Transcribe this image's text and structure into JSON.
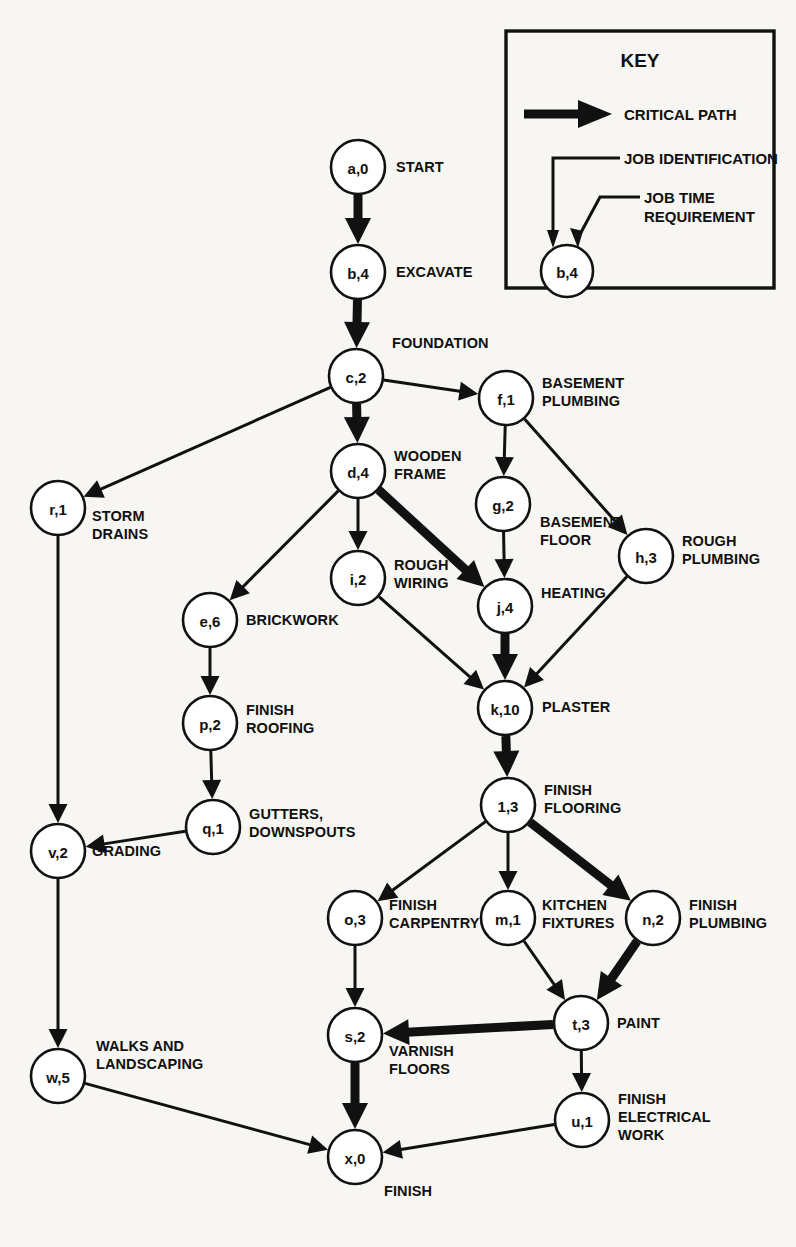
{
  "diagram": {
    "background_color": "#f7f6f2",
    "ink_color": "#111111",
    "node_fill": "#ffffff"
  },
  "key": {
    "title": "KEY",
    "critical_path_label": "CRITICAL PATH",
    "job_identification_label": "JOB IDENTIFICATION",
    "job_time_line1": "JOB TIME",
    "job_time_line2": "REQUIREMENT",
    "sample_node_label": "b,4"
  },
  "nodes": [
    {
      "id": "a",
      "label": "a,0",
      "cx": 358,
      "cy": 167,
      "r": 27,
      "job": [
        "START"
      ],
      "job_x": 396,
      "job_y": 172,
      "anchor": "start"
    },
    {
      "id": "b",
      "label": "b,4",
      "cx": 358,
      "cy": 272,
      "r": 27,
      "job": [
        "EXCAVATE"
      ],
      "job_x": 396,
      "job_y": 277,
      "anchor": "start"
    },
    {
      "id": "c",
      "label": "c,2",
      "cx": 356,
      "cy": 376,
      "r": 27,
      "job": [
        "FOUNDATION"
      ],
      "job_x": 392,
      "job_y": 348,
      "anchor": "start"
    },
    {
      "id": "d",
      "label": "d,4",
      "cx": 358,
      "cy": 471,
      "r": 27,
      "job": [
        "WOODEN",
        "FRAME"
      ],
      "job_x": 394,
      "job_y": 461,
      "anchor": "start"
    },
    {
      "id": "f",
      "label": "f,1",
      "cx": 506,
      "cy": 398,
      "r": 27,
      "job": [
        "BASEMENT",
        "PLUMBING"
      ],
      "job_x": 542,
      "job_y": 388,
      "anchor": "start"
    },
    {
      "id": "g",
      "label": "g,2",
      "cx": 503,
      "cy": 504,
      "r": 27,
      "job": [
        "BASEMENT",
        "FLOOR"
      ],
      "job_x": 540,
      "job_y": 527,
      "anchor": "start"
    },
    {
      "id": "h",
      "label": "h,3",
      "cx": 646,
      "cy": 556,
      "r": 27,
      "job": [
        "ROUGH",
        "PLUMBING"
      ],
      "job_x": 682,
      "job_y": 546,
      "anchor": "start"
    },
    {
      "id": "r",
      "label": "r,1",
      "cx": 58,
      "cy": 508,
      "r": 27,
      "job": [
        "STORM",
        "DRAINS"
      ],
      "job_x": 92,
      "job_y": 521,
      "anchor": "start"
    },
    {
      "id": "i",
      "label": "i,2",
      "cx": 358,
      "cy": 578,
      "r": 27,
      "job": [
        "ROUGH",
        "WIRING"
      ],
      "job_x": 394,
      "job_y": 570,
      "anchor": "start"
    },
    {
      "id": "j",
      "label": "j,4",
      "cx": 505,
      "cy": 606,
      "r": 27,
      "job": [
        "HEATING"
      ],
      "job_x": 541,
      "job_y": 598,
      "anchor": "start"
    },
    {
      "id": "e",
      "label": "e,6",
      "cx": 210,
      "cy": 620,
      "r": 27,
      "job": [
        "BRICKWORK"
      ],
      "job_x": 246,
      "job_y": 625,
      "anchor": "start"
    },
    {
      "id": "k",
      "label": "k,10",
      "cx": 505,
      "cy": 708,
      "r": 27,
      "job": [
        "PLASTER"
      ],
      "job_x": 542,
      "job_y": 712,
      "anchor": "start"
    },
    {
      "id": "p",
      "label": "p,2",
      "cx": 210,
      "cy": 723,
      "r": 27,
      "job": [
        "FINISH",
        "ROOFING"
      ],
      "job_x": 246,
      "job_y": 715,
      "anchor": "start"
    },
    {
      "id": "l",
      "label": "1,3",
      "cx": 508,
      "cy": 805,
      "r": 27,
      "job": [
        "FINISH",
        "FLOORING"
      ],
      "job_x": 544,
      "job_y": 795,
      "anchor": "start"
    },
    {
      "id": "q",
      "label": "q,1",
      "cx": 213,
      "cy": 827,
      "r": 27,
      "job": [
        "GUTTERS,",
        "DOWNSPOUTS"
      ],
      "job_x": 249,
      "job_y": 819,
      "anchor": "start"
    },
    {
      "id": "v",
      "label": "v,2",
      "cx": 58,
      "cy": 851,
      "r": 27,
      "job": [
        "GRADING"
      ],
      "job_x": 92,
      "job_y": 856,
      "anchor": "start"
    },
    {
      "id": "o",
      "label": "o,3",
      "cx": 355,
      "cy": 918,
      "r": 27,
      "job": [
        "FINISH",
        "CARPENTRY"
      ],
      "job_x": 389,
      "job_y": 910,
      "anchor": "start"
    },
    {
      "id": "m",
      "label": "m,1",
      "cx": 508,
      "cy": 918,
      "r": 27,
      "job": [
        "KITCHEN",
        "FIXTURES"
      ],
      "job_x": 542,
      "job_y": 910,
      "anchor": "start"
    },
    {
      "id": "n",
      "label": "n,2",
      "cx": 653,
      "cy": 918,
      "r": 27,
      "job": [
        "FINISH",
        "PLUMBING"
      ],
      "job_x": 689,
      "job_y": 910,
      "anchor": "start"
    },
    {
      "id": "t",
      "label": "t,3",
      "cx": 581,
      "cy": 1023,
      "r": 27,
      "job": [
        "PAINT"
      ],
      "job_x": 617,
      "job_y": 1028,
      "anchor": "start"
    },
    {
      "id": "s",
      "label": "s,2",
      "cx": 355,
      "cy": 1035,
      "r": 27,
      "job": [
        "VARNISH",
        "FLOORS"
      ],
      "job_x": 389,
      "job_y": 1056,
      "anchor": "start"
    },
    {
      "id": "w",
      "label": "w,5",
      "cx": 58,
      "cy": 1076,
      "r": 27,
      "job": [
        "WALKS AND",
        "LANDSCAPING"
      ],
      "job_x": 96,
      "job_y": 1051,
      "anchor": "start"
    },
    {
      "id": "u",
      "label": "u,1",
      "cx": 582,
      "cy": 1120,
      "r": 27,
      "job": [
        "FINISH",
        "ELECTRICAL",
        "WORK"
      ],
      "job_x": 618,
      "job_y": 1104,
      "anchor": "start"
    },
    {
      "id": "x",
      "label": "x,0",
      "cx": 355,
      "cy": 1157,
      "r": 27,
      "job": [
        "FINISH"
      ],
      "job_x": 384,
      "job_y": 1196,
      "anchor": "start"
    }
  ],
  "edges": [
    {
      "from": "a",
      "to": "b",
      "critical": true
    },
    {
      "from": "b",
      "to": "c",
      "critical": true
    },
    {
      "from": "c",
      "to": "d",
      "critical": true
    },
    {
      "from": "c",
      "to": "f",
      "critical": false
    },
    {
      "from": "c",
      "to": "r",
      "critical": false
    },
    {
      "from": "f",
      "to": "g",
      "critical": false
    },
    {
      "from": "f",
      "to": "h",
      "critical": false
    },
    {
      "from": "d",
      "to": "i",
      "critical": false
    },
    {
      "from": "d",
      "to": "e",
      "critical": false
    },
    {
      "from": "d",
      "to": "j",
      "critical": true
    },
    {
      "from": "g",
      "to": "j",
      "critical": false
    },
    {
      "from": "j",
      "to": "k",
      "critical": true
    },
    {
      "from": "h",
      "to": "k",
      "critical": false
    },
    {
      "from": "i",
      "to": "k",
      "critical": false
    },
    {
      "from": "e",
      "to": "p",
      "critical": false
    },
    {
      "from": "p",
      "to": "q",
      "critical": false
    },
    {
      "from": "q",
      "to": "v",
      "critical": false
    },
    {
      "from": "r",
      "to": "v",
      "critical": false
    },
    {
      "from": "k",
      "to": "l",
      "critical": true
    },
    {
      "from": "l",
      "to": "o",
      "critical": false
    },
    {
      "from": "l",
      "to": "m",
      "critical": false
    },
    {
      "from": "l",
      "to": "n",
      "critical": true
    },
    {
      "from": "m",
      "to": "t",
      "critical": false
    },
    {
      "from": "n",
      "to": "t",
      "critical": true
    },
    {
      "from": "o",
      "to": "s",
      "critical": false
    },
    {
      "from": "t",
      "to": "s",
      "critical": true
    },
    {
      "from": "t",
      "to": "u",
      "critical": false
    },
    {
      "from": "s",
      "to": "x",
      "critical": true
    },
    {
      "from": "u",
      "to": "x",
      "critical": false
    },
    {
      "from": "v",
      "to": "w",
      "critical": false
    },
    {
      "from": "w",
      "to": "x",
      "critical": false
    }
  ]
}
